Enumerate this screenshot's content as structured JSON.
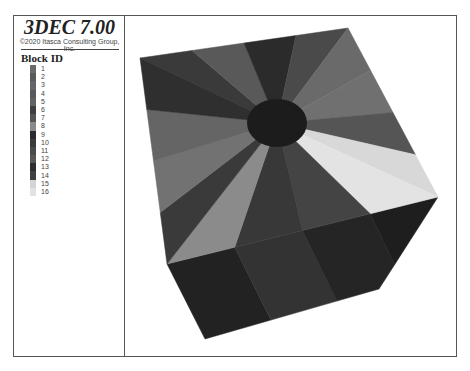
{
  "header": {
    "title": "3DEC 7.00",
    "copyright": "©2020 Itasca Consulting Group, Inc."
  },
  "legend": {
    "heading": "Block ID",
    "items": [
      {
        "label": "1",
        "color": "#6b6b6b"
      },
      {
        "label": "2",
        "color": "#5a5a5a"
      },
      {
        "label": "3",
        "color": "#666666"
      },
      {
        "label": "4",
        "color": "#595959"
      },
      {
        "label": "5",
        "color": "#626262"
      },
      {
        "label": "6",
        "color": "#3e3e3e"
      },
      {
        "label": "7",
        "color": "#555555"
      },
      {
        "label": "8",
        "color": "#8a8a8a"
      },
      {
        "label": "9",
        "color": "#2a2a2a"
      },
      {
        "label": "10",
        "color": "#3b3b3b"
      },
      {
        "label": "11",
        "color": "#4a4a4a"
      },
      {
        "label": "12",
        "color": "#575757"
      },
      {
        "label": "13",
        "color": "#2e2e2e"
      },
      {
        "label": "14",
        "color": "#404040"
      },
      {
        "label": "15",
        "color": "#d4d4d4"
      },
      {
        "label": "16",
        "color": "#e2e2e2"
      }
    ]
  },
  "scene": {
    "description": "3D block model: cube with radial blocks around a central circular hole",
    "hole_color": "#1c1c1c",
    "top_face_wedges": [
      {
        "block": 10,
        "color": "#3a3a3a"
      },
      {
        "block": 4,
        "color": "#595959"
      },
      {
        "block": 9,
        "color": "#2b2b2b"
      },
      {
        "block": 11,
        "color": "#4a4a4a"
      },
      {
        "block": 1,
        "color": "#6a6a6a"
      },
      {
        "block": 3,
        "color": "#707070"
      },
      {
        "block": 12,
        "color": "#555555"
      },
      {
        "block": 16,
        "color": "#d8d8d8"
      },
      {
        "block": 15,
        "color": "#e3e3e3"
      },
      {
        "block": 6,
        "color": "#444444"
      },
      {
        "block": 14,
        "color": "#383838"
      },
      {
        "block": 8,
        "color": "#8b8b8b"
      },
      {
        "block": 13,
        "color": "#3a3a3a"
      },
      {
        "block": 2,
        "color": "#727272"
      },
      {
        "block": 5,
        "color": "#656565"
      },
      {
        "block": 7,
        "color": "#2f2f2f"
      }
    ],
    "front_face_colors": [
      "#222222",
      "#333333",
      "#252525",
      "#1e1e1e"
    ]
  }
}
